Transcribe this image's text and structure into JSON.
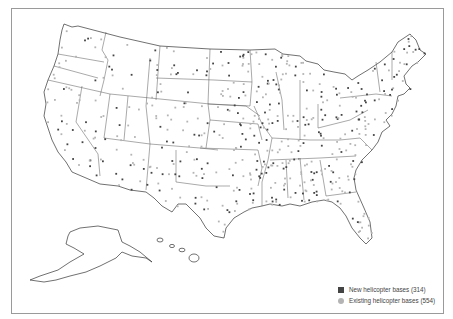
{
  "map": {
    "subject": "Helicopter bases in the United States",
    "colors": {
      "new_base": "#444444",
      "existing_base": "#b4b4b4",
      "outline": "#333333"
    }
  },
  "legend": {
    "items": [
      {
        "label": "New helicopter bases (314)",
        "marker": "square",
        "color": "#444444"
      },
      {
        "label": "Existing helicopter bases (554)",
        "marker": "circle",
        "color": "#b4b4b4"
      }
    ]
  }
}
